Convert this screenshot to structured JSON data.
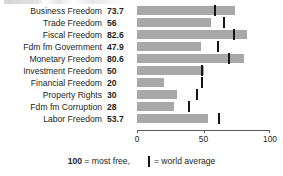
{
  "legend": {
    "scale_note_number": "100",
    "scale_note_text": " = most free,",
    "average_note_text": "= world average",
    "marker_icon": "vertical-tick-icon"
  },
  "axis": {
    "ticks": [
      "0",
      "50",
      "100"
    ],
    "tick_values": [
      0,
      50,
      100
    ]
  },
  "colors": {
    "bar": "#a8a8a8",
    "marker": "#141414",
    "text": "#231f20",
    "axis": "#5a5a5a"
  },
  "chart_data": {
    "type": "bar",
    "orientation": "horizontal",
    "title": "",
    "subtitle": "",
    "xlabel": "",
    "ylabel": "",
    "xlim": [
      0,
      100
    ],
    "grid": false,
    "legend_position": "bottom",
    "categories": [
      "Business Freedom",
      "Trade Freedom",
      "Fiscal Freedom",
      "Fdm fm Government",
      "Monetary Freedom",
      "Investment Freedom",
      "Financial Freedom",
      "Property Rights",
      "Fdm fm Corruption",
      "Labor Freedom"
    ],
    "values": [
      73.7,
      56,
      82.6,
      47.9,
      80.6,
      50,
      20,
      30,
      28,
      53.7
    ],
    "value_labels": [
      "73.7",
      "56",
      "82.6",
      "47.9",
      "80.6",
      "50",
      "20",
      "30",
      "28",
      "53.7"
    ],
    "series": [
      {
        "name": "Country score",
        "values": [
          73.7,
          56,
          82.6,
          47.9,
          80.6,
          50,
          20,
          30,
          28,
          53.7
        ]
      },
      {
        "name": "World average",
        "marker": "vertical-tick",
        "values": [
          59.0,
          65.5,
          73.0,
          61.0,
          69.0,
          49.0,
          49.0,
          45.0,
          39.0,
          62.0
        ]
      }
    ],
    "annotations": [
      "100 = most free,",
      "| = world average"
    ]
  }
}
